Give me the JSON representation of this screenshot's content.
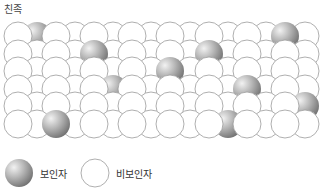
{
  "title": "친족",
  "colors": {
    "carrier_light": "#f2f2f2",
    "carrier_mid": "#b8b8b8",
    "carrier_dark": "#6e6e6e",
    "noncarrier_fill": "#ffffff",
    "stroke": "#9a9a9a"
  },
  "grid": {
    "radius": 14,
    "front_x": [
      18,
      56,
      94,
      132,
      170,
      209,
      247,
      285
    ],
    "back_x": [
      37,
      75,
      113,
      151,
      190,
      228,
      266,
      305
    ],
    "rows": [
      {
        "y": 36,
        "carriers_back": [
          37
        ],
        "carriers_front": [
          285
        ]
      },
      {
        "y": 54,
        "carriers_back": [],
        "carriers_front": [
          94,
          209
        ]
      },
      {
        "y": 71,
        "carriers_back": [],
        "carriers_front": [
          170
        ]
      },
      {
        "y": 89,
        "carriers_back": [
          113
        ],
        "carriers_front": [
          247
        ]
      },
      {
        "y": 106,
        "carriers_back": [
          305
        ],
        "carriers_front": []
      },
      {
        "y": 124,
        "carriers_back": [
          228
        ],
        "carriers_front": [
          56
        ]
      }
    ]
  },
  "legend": {
    "carrier": {
      "label": "보인자",
      "icon": "shaded-sphere-icon"
    },
    "noncarrier": {
      "label": "비보인자",
      "icon": "empty-circle-icon"
    }
  }
}
